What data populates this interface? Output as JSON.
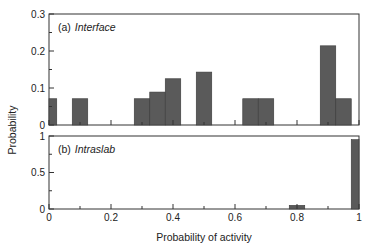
{
  "chart_data": [
    {
      "type": "bar",
      "panel": "(a)",
      "title": "Interface",
      "xlabel": "Probability of activity",
      "ylabel": "Probability",
      "xlim": [
        0,
        1
      ],
      "ylim": [
        0,
        0.3
      ],
      "yticks": [
        "0",
        "0.1",
        "0.2",
        "0.3"
      ],
      "bar_width": 0.05,
      "x": [
        0.0,
        0.1,
        0.3,
        0.35,
        0.4,
        0.5,
        0.65,
        0.7,
        0.9,
        0.95
      ],
      "values": [
        0.071,
        0.071,
        0.071,
        0.089,
        0.125,
        0.143,
        0.071,
        0.071,
        0.214,
        0.071
      ],
      "color": "#5a5a5a"
    },
    {
      "type": "bar",
      "panel": "(b)",
      "title": "Intraslab",
      "xlabel": "Probability of activity",
      "ylabel": "Probability",
      "xlim": [
        0,
        1
      ],
      "ylim": [
        0,
        1
      ],
      "yticks": [
        "0",
        "0.5",
        "1"
      ],
      "xticks": [
        "0",
        "0.2",
        "0.4",
        "0.6",
        "0.8",
        "1"
      ],
      "bar_width": 0.05,
      "x": [
        0.8,
        1.0
      ],
      "values": [
        0.05,
        0.95
      ],
      "color": "#5a5a5a"
    }
  ],
  "labels": {
    "panel_a_letter": "(a)",
    "panel_a_name": "Interface",
    "panel_b_letter": "(b)",
    "panel_b_name": "Intraslab",
    "xlabel": "Probability of activity",
    "ylabel": "Probability"
  },
  "top_yticks": [
    "0",
    "0.1",
    "0.2",
    "0.3"
  ],
  "bottom_yticks": [
    "0",
    "0.5",
    "1"
  ],
  "xticks": [
    "0",
    "0.2",
    "0.4",
    "0.6",
    "0.8",
    "1"
  ]
}
